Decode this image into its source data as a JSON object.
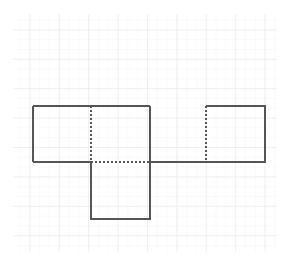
{
  "figure": {
    "canvas": {
      "width": 289,
      "height": 266,
      "background": "#ffffff"
    },
    "grid": {
      "name": "graph-paper-grid",
      "x_start": 13,
      "y_start": 14,
      "x_end": 277,
      "y_end": 252,
      "minor_spacing": 9.8,
      "major_spacing": 29.4,
      "minor_color": "#e9e9ee",
      "major_color": "#e2e2e9",
      "minor_dash": "1,1",
      "show_grid": true
    },
    "stroke": {
      "color": "#555555",
      "width": 1.4,
      "dash_pattern": "2,2"
    },
    "shapes": [
      {
        "name": "left-rectangle",
        "type": "rectangle",
        "x": 33,
        "y": 106,
        "width": 117,
        "height": 56,
        "style": "solid"
      },
      {
        "name": "bottom-square",
        "type": "rectangle",
        "x": 91,
        "y": 162,
        "width": 59,
        "height": 57,
        "style": "solid"
      },
      {
        "name": "right-square",
        "type": "rectangle",
        "x": 206,
        "y": 106,
        "width": 59,
        "height": 56,
        "style": "solid-with-dashed-left"
      }
    ],
    "segments": [
      {
        "name": "top-edge-left-rectangle",
        "x1": 33,
        "y1": 106,
        "x2": 150,
        "y2": 106,
        "style": "solid"
      },
      {
        "name": "left-edge-left-rectangle",
        "x1": 33,
        "y1": 106,
        "x2": 33,
        "y2": 162,
        "style": "solid"
      },
      {
        "name": "right-edge-left-rectangle",
        "x1": 150,
        "y1": 106,
        "x2": 150,
        "y2": 162,
        "style": "solid"
      },
      {
        "name": "interior-dashed-vertical",
        "x1": 91,
        "y1": 106,
        "x2": 91,
        "y2": 162,
        "style": "dashed"
      },
      {
        "name": "baseline-solid-left",
        "x1": 33,
        "y1": 162,
        "x2": 91,
        "y2": 162,
        "style": "solid"
      },
      {
        "name": "baseline-dashed-middle",
        "x1": 91,
        "y1": 162,
        "x2": 150,
        "y2": 162,
        "style": "dashed"
      },
      {
        "name": "baseline-solid-right",
        "x1": 150,
        "y1": 162,
        "x2": 265,
        "y2": 162,
        "style": "solid"
      },
      {
        "name": "left-edge-bottom-square",
        "x1": 91,
        "y1": 162,
        "x2": 91,
        "y2": 219,
        "style": "solid"
      },
      {
        "name": "right-edge-bottom-square",
        "x1": 150,
        "y1": 162,
        "x2": 150,
        "y2": 219,
        "style": "solid"
      },
      {
        "name": "bottom-edge-bottom-square",
        "x1": 91,
        "y1": 219,
        "x2": 150,
        "y2": 219,
        "style": "solid"
      },
      {
        "name": "top-edge-right-square",
        "x1": 206,
        "y1": 106,
        "x2": 265,
        "y2": 106,
        "style": "solid"
      },
      {
        "name": "right-edge-right-square",
        "x1": 265,
        "y1": 106,
        "x2": 265,
        "y2": 162,
        "style": "solid"
      },
      {
        "name": "left-edge-right-square-dashed",
        "x1": 206,
        "y1": 106,
        "x2": 206,
        "y2": 162,
        "style": "dashed"
      }
    ]
  }
}
